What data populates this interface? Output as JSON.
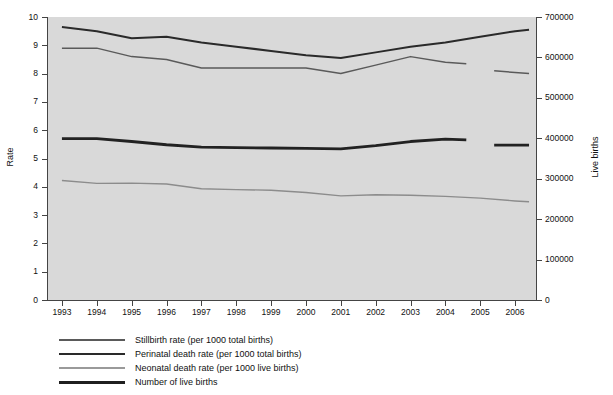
{
  "chart_data": {
    "type": "line",
    "title": "",
    "xlabel": "",
    "ylabel": "Rate",
    "y2label": "Live births",
    "x": [
      1993,
      1994,
      1995,
      1996,
      1997,
      1998,
      1999,
      2000,
      2001,
      2002,
      2003,
      2004,
      2005,
      2006
    ],
    "xlim": [
      1992.6,
      2006.6
    ],
    "ylim": [
      0,
      10
    ],
    "y2lim": [
      0,
      700000
    ],
    "xticks": [
      "1993",
      "1994",
      "1995",
      "1996",
      "1997",
      "1998",
      "1999",
      "2000",
      "2001",
      "2002",
      "2003",
      "2004",
      "2005",
      "2006"
    ],
    "yticks": [
      "0",
      "1",
      "2",
      "3",
      "4",
      "5",
      "6",
      "7",
      "8",
      "9",
      "10"
    ],
    "y2ticks": [
      "0",
      "100000",
      "200000",
      "300000",
      "400000",
      "500000",
      "600000",
      "700000"
    ],
    "grid": false,
    "legend_position": "below",
    "series": [
      {
        "name": "Stillbirth rate (per 1000 total births)",
        "axis": "left",
        "color": "#5a5a5a",
        "width": 1.5,
        "x": [
          1993,
          1994,
          1995,
          1996,
          1997,
          1998,
          1999,
          2000,
          2001,
          2002,
          2003,
          2004,
          2004.6
        ],
        "values": [
          8.9,
          8.9,
          8.6,
          8.5,
          8.2,
          8.2,
          8.2,
          8.2,
          8.0,
          8.3,
          8.6,
          8.4,
          8.35
        ]
      },
      {
        "name": "Stillbirth rate (per 1000 total births) [2005-2006]",
        "axis": "left",
        "color": "#5a5a5a",
        "width": 1.5,
        "x": [
          2005.4,
          2006.4
        ],
        "values": [
          8.1,
          8.0
        ]
      },
      {
        "name": "Perinatal death rate (per 1000 total births)",
        "axis": "left",
        "color": "#2a2a2a",
        "width": 2.0,
        "x": [
          1993,
          1994,
          1995,
          1996,
          1997,
          1998,
          1999,
          2000,
          2001,
          2002,
          2003,
          2004,
          2005,
          2006,
          2006.4
        ],
        "values": [
          9.65,
          9.5,
          9.25,
          9.3,
          9.1,
          8.95,
          8.8,
          8.65,
          8.55,
          8.75,
          8.95,
          9.1,
          9.3,
          9.5,
          9.55
        ]
      },
      {
        "name": "Neonatal death rate (per 1000 live births)",
        "axis": "left",
        "color": "#8c8c8c",
        "width": 1.4,
        "x": [
          1993,
          1994,
          1995,
          1996,
          1997,
          1998,
          1999,
          2000,
          2001,
          2002,
          2003,
          2004,
          2005,
          2006,
          2006.4
        ],
        "values": [
          4.22,
          4.12,
          4.13,
          4.1,
          3.93,
          3.9,
          3.88,
          3.8,
          3.68,
          3.72,
          3.7,
          3.66,
          3.6,
          3.5,
          3.47
        ]
      },
      {
        "name": "Number of live births",
        "axis": "right",
        "color": "#222222",
        "width": 2.8,
        "x": [
          1993,
          1994,
          1995,
          1996,
          1997,
          1998,
          1999,
          2000,
          2001,
          2002,
          2003,
          2004,
          2004.6
        ],
        "values": [
          399000,
          399000,
          392000,
          384000,
          378000,
          377000,
          376000,
          375000,
          374000,
          382000,
          392000,
          398000,
          396000
        ]
      },
      {
        "name": "Number of live births [2005-2006]",
        "axis": "right",
        "color": "#222222",
        "width": 2.8,
        "x": [
          2005.4,
          2006.4
        ],
        "values": [
          383000,
          383000
        ]
      }
    ]
  },
  "legend": {
    "items": [
      {
        "label": "Stillbirth rate (per 1000 total births)",
        "color": "#5a5a5a",
        "width": 1.6
      },
      {
        "label": "Perinatal death rate (per 1000 total births)",
        "color": "#2a2a2a",
        "width": 2.2
      },
      {
        "label": "Neonatal death rate (per 1000 live births)",
        "color": "#9a9a9a",
        "width": 1.3
      },
      {
        "label": "Number of live births",
        "color": "#1f1f1f",
        "width": 3.0
      }
    ]
  },
  "colors": {
    "plot_background": "#d9d9d9",
    "page_background": "#ffffff",
    "axis": "#444444",
    "text": "#111111"
  }
}
